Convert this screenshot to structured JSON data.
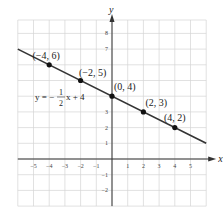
{
  "chart_data": {
    "type": "line",
    "title": "",
    "xlabel": "x",
    "ylabel": "y",
    "xlim": [
      -6,
      6
    ],
    "ylim": [
      -3,
      9
    ],
    "grid": true,
    "x_ticks": [
      -5,
      -4,
      -3,
      -2,
      -1,
      1,
      2,
      3,
      4,
      5
    ],
    "y_ticks": [
      -2,
      -1,
      1,
      2,
      3,
      7,
      8
    ],
    "series": [
      {
        "name": "y = -1/2 x + 4",
        "equation": "y = -½x + 4",
        "slope": -0.5,
        "intercept": 4,
        "points": [
          {
            "x": -4,
            "y": 6,
            "label": "(−4, 6)"
          },
          {
            "x": -2,
            "y": 5,
            "label": "(−2, 5)"
          },
          {
            "x": 0,
            "y": 4,
            "label": "(0, 4)"
          },
          {
            "x": 2,
            "y": 3,
            "label": "(2, 3)"
          },
          {
            "x": 4,
            "y": 2,
            "label": "(4, 2)"
          }
        ]
      }
    ],
    "annotations": {
      "equation_prefix": "y = −",
      "fraction_num": "1",
      "fraction_den": "2",
      "equation_suffix": "x + 4"
    },
    "colors": {
      "line": "#333333",
      "grid": "#d4d4d4",
      "axis": "#333333",
      "point": "#111111"
    }
  }
}
